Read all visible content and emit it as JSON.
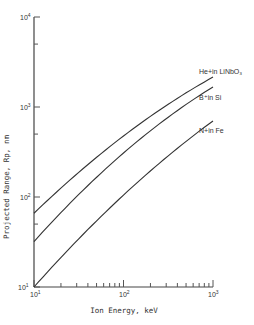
{
  "chart_data": {
    "type": "line",
    "title": "",
    "xlabel": "Ion Energy, keV",
    "ylabel": "Projected Range, Rp, nm",
    "xscale": "log",
    "yscale": "log",
    "xlim": [
      10,
      1000
    ],
    "ylim": [
      10,
      10000
    ],
    "x_ticks": [
      "10^1",
      "10^2",
      "10^3"
    ],
    "y_ticks": [
      "10^1",
      "10^2",
      "10^3",
      "10^4"
    ],
    "grid": false,
    "x": [
      10,
      100,
      1000
    ],
    "series": [
      {
        "name": "He+ in LiNbO3",
        "values": [
          66,
          476,
          2150
        ]
      },
      {
        "name": "B+ in Si",
        "values": [
          32,
          308,
          1670
        ]
      },
      {
        "name": "N+ in Fe",
        "values": [
          10,
          105,
          700
        ]
      }
    ],
    "legend_position": "inline-right"
  },
  "labels": {
    "xlabel": "Ion Energy, keV",
    "ylabel": "Projected   Range, Rp, nm",
    "x_tick_base": [
      "10",
      "10",
      "10"
    ],
    "x_tick_exp": [
      "1",
      "2",
      "3"
    ],
    "y_tick_base": [
      "10",
      "10",
      "10",
      "10"
    ],
    "y_tick_exp": [
      "1",
      "2",
      "3",
      "4"
    ],
    "series_labels": [
      "He+in LiNbO₃",
      "B⁺in Si",
      "N+in Fe"
    ]
  }
}
